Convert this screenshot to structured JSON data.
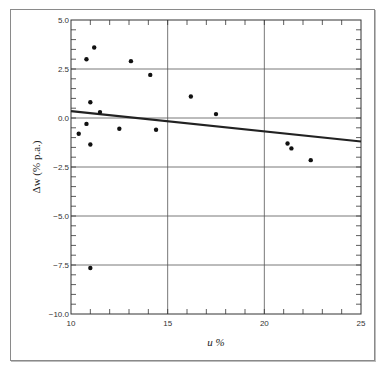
{
  "chart_data": {
    "type": "scatter",
    "title": "",
    "xlabel": "u %",
    "ylabel": "Δw (% p.a.)",
    "xlim": [
      10,
      25
    ],
    "ylim": [
      -10.0,
      5.0
    ],
    "x_ticks": [
      10,
      15,
      20,
      25
    ],
    "x_tick_labels": [
      "10",
      "15",
      "20",
      "25"
    ],
    "y_ticks": [
      5.0,
      2.5,
      0.0,
      -2.5,
      -5.0,
      -7.5,
      -10.0
    ],
    "y_tick_labels": [
      "5.0",
      "2.5",
      "0.0",
      "-2.5",
      "-5.0",
      "-7.5",
      "-10.0"
    ],
    "grid": true,
    "legend": null,
    "series": [
      {
        "name": "observations",
        "kind": "scatter",
        "points": [
          {
            "x": 11.2,
            "y": 3.6
          },
          {
            "x": 10.8,
            "y": 3.0
          },
          {
            "x": 13.1,
            "y": 2.9
          },
          {
            "x": 14.1,
            "y": 2.2
          },
          {
            "x": 16.2,
            "y": 1.1
          },
          {
            "x": 11.0,
            "y": 0.8
          },
          {
            "x": 11.5,
            "y": 0.3
          },
          {
            "x": 17.5,
            "y": 0.2
          },
          {
            "x": 10.8,
            "y": -0.3
          },
          {
            "x": 12.5,
            "y": -0.55
          },
          {
            "x": 14.4,
            "y": -0.6
          },
          {
            "x": 10.4,
            "y": -0.8
          },
          {
            "x": 11.0,
            "y": -1.35
          },
          {
            "x": 21.2,
            "y": -1.3
          },
          {
            "x": 21.4,
            "y": -1.55
          },
          {
            "x": 22.4,
            "y": -2.15
          },
          {
            "x": 11.0,
            "y": -7.65
          }
        ]
      },
      {
        "name": "fitted regression line",
        "kind": "line",
        "points": [
          {
            "x": 10,
            "y": 0.35
          },
          {
            "x": 25,
            "y": -1.2
          }
        ]
      }
    ]
  },
  "colors": {
    "frame": "#8a8a8a",
    "axis": "#333333",
    "grid": "#555555",
    "points": "#111111",
    "regression_line": "#222222"
  }
}
